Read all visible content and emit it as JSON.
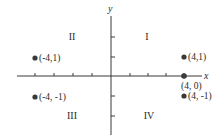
{
  "diagram": {
    "axes": {
      "x_label": "x",
      "y_label": "y",
      "x_ticks": [
        -4,
        -3,
        -2,
        -1,
        1,
        2,
        3,
        4
      ],
      "y_ticks": [
        -2,
        -1,
        1,
        2
      ]
    },
    "quadrants": [
      {
        "label": "I",
        "position": "top-right"
      },
      {
        "label": "II",
        "position": "top-left"
      },
      {
        "label": "III",
        "position": "bottom-left"
      },
      {
        "label": "IV",
        "position": "bottom-right"
      }
    ],
    "points": [
      {
        "x": -4,
        "y": 1,
        "label": "(-4,1)"
      },
      {
        "x": -4,
        "y": -1,
        "label": "(-4, -1)"
      },
      {
        "x": 4,
        "y": 1,
        "label": "(4,1)"
      },
      {
        "x": 4,
        "y": 0,
        "label": "(4, 0)"
      },
      {
        "x": 4,
        "y": -1,
        "label": "(4, -1)"
      }
    ],
    "colors": {
      "axis": "#3a3a3a",
      "point": "#3a3a3a",
      "text": "#2a2a2a",
      "background": "#ffffff"
    }
  }
}
